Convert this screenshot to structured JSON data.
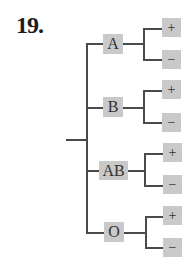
{
  "problem_number": "19.",
  "tree": {
    "root": "",
    "branches": [
      {
        "label": "A",
        "children": [
          "+",
          "−"
        ]
      },
      {
        "label": "B",
        "children": [
          "+",
          "−"
        ]
      },
      {
        "label": "AB",
        "children": [
          "+",
          "−"
        ]
      },
      {
        "label": "O",
        "children": [
          "+",
          "−"
        ]
      }
    ]
  },
  "colors": {
    "box_fill": "#c9c9c9",
    "line": "#4a4a4a"
  }
}
